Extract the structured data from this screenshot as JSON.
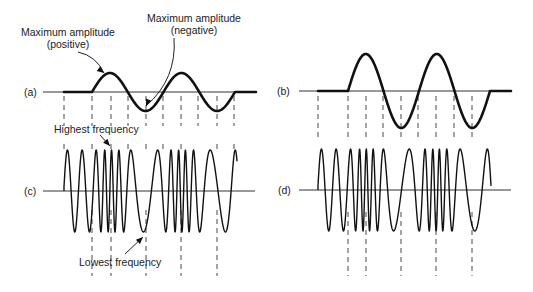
{
  "labels": {
    "max_pos_line1": "Maximum amplitude",
    "max_pos_line2": "(positive)",
    "max_neg_line1": "Maximum amplitude",
    "max_neg_line2": "(negative)",
    "highest_freq": "Highest frequency",
    "lowest_freq": "Lowest frequency"
  },
  "panels": {
    "a": {
      "label": "(a)",
      "type": "modulating",
      "baseline_y": 92,
      "axis_x": [
        43,
        256
      ],
      "flat_start": 64,
      "start": 92,
      "end": 235,
      "flat_end": 256,
      "half_period": 35.7,
      "amplitude": 19,
      "dash_x": [
        64,
        92,
        111,
        128,
        146,
        163,
        181,
        198,
        217,
        234
      ],
      "dash_y": [
        96,
        126
      ]
    },
    "b": {
      "label": "(b)",
      "type": "modulating",
      "baseline_y": 91,
      "axis_x": [
        299,
        511
      ],
      "flat_start": 318,
      "start": 348,
      "end": 490,
      "flat_end": 511,
      "half_period": 35.5,
      "amplitude": 37,
      "dash_x": [
        318,
        348,
        366,
        383,
        401,
        418,
        436,
        454,
        472
      ],
      "dash_y": [
        96,
        140
      ]
    },
    "c": {
      "label": "(c)",
      "type": "fm",
      "baseline_y": 191,
      "axis_x": [
        43,
        255
      ],
      "start": 64,
      "end": 237,
      "amplitude": 41,
      "mod_ref": "a",
      "base_cycles_per_px": 0.068,
      "deviation": 0.55,
      "dash_top_x": [
        64,
        92,
        111,
        128,
        146,
        163,
        181,
        217,
        234
      ],
      "dash_top_y": [
        144,
        149
      ],
      "dash_bottom_x": [
        92,
        111,
        146,
        181,
        217
      ],
      "dash_bottom_y": [
        210,
        276
      ]
    },
    "d": {
      "label": "(d)",
      "type": "fm",
      "baseline_y": 190,
      "axis_x": [
        299,
        511
      ],
      "start": 318,
      "end": 491,
      "amplitude": 41,
      "mod_ref": "b",
      "base_cycles_per_px": 0.068,
      "deviation": 0.58,
      "dash_top_x": [],
      "dash_top_y": [],
      "dash_bottom_x": [
        348,
        366,
        401,
        436,
        472
      ],
      "dash_bottom_y": [
        212,
        276
      ]
    }
  },
  "annotations": {
    "max_pos_arrow": {
      "from": [
        78,
        52
      ],
      "to": [
        104,
        73
      ]
    },
    "max_neg_arrow": {
      "from": [
        174,
        38
      ],
      "to": [
        146,
        106
      ]
    },
    "highest_arrow": {
      "from": [
        100,
        135
      ],
      "to": [
        110,
        146
      ]
    },
    "lowest_arrow": {
      "from": [
        125,
        254
      ],
      "to": [
        143,
        237
      ]
    }
  }
}
